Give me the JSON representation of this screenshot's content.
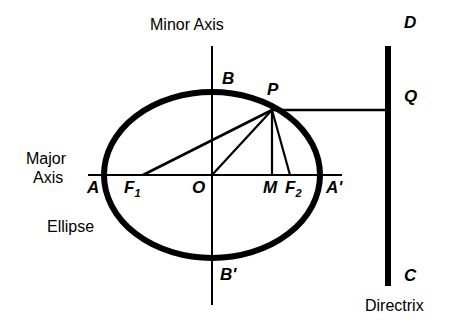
{
  "figure": {
    "background_color": "#ffffff",
    "stroke_color": "#000000"
  },
  "labels": {
    "minor_axis": "Minor Axis",
    "major_axis_line1": "Major",
    "major_axis_line2": "Axis",
    "ellipse": "Ellipse",
    "directrix": "Directrix",
    "vertex_a": "A",
    "vertex_a_prime_base": "A",
    "vertex_a_prime_mark": "'",
    "covertex_b": "B",
    "covertex_b_prime_base": "B",
    "covertex_b_prime_mark": "'",
    "center_o": "O",
    "point_p": "P",
    "point_m": "M",
    "focus_1_base": "F",
    "focus_1_sub": "1",
    "focus_2_base": "F",
    "focus_2_sub": "2",
    "directrix_top_d": "D",
    "directrix_q": "Q",
    "directrix_bottom_c": "C"
  },
  "geometry": {
    "center": {
      "x": 212,
      "y": 175
    },
    "semi_major_axis": 108,
    "semi_minor_axis": 83,
    "vertex_a": {
      "x": 104,
      "y": 175
    },
    "vertex_a_prime": {
      "x": 320,
      "y": 175
    },
    "covertex_b": {
      "x": 212,
      "y": 92
    },
    "covertex_b_prime": {
      "x": 212,
      "y": 258
    },
    "focus_1": {
      "x": 143,
      "y": 175
    },
    "focus_2": {
      "x": 290,
      "y": 175
    },
    "point_p": {
      "x": 272,
      "y": 110
    },
    "point_m": {
      "x": 272,
      "y": 175
    },
    "point_q": {
      "x": 388,
      "y": 110
    },
    "major_axis_line": {
      "x1": 88,
      "y1": 175,
      "x2": 342,
      "y2": 175
    },
    "minor_axis_line": {
      "x1": 212,
      "y1": 46,
      "x2": 212,
      "y2": 305
    },
    "directrix_line": {
      "x": 388,
      "y1": 46,
      "y2": 286
    },
    "ellipse_stroke_width": 6,
    "directrix_stroke_width": 6,
    "thin_stroke_width": 2
  },
  "segments": [
    {
      "name": "p-to-f1",
      "from": "point_p",
      "to": "focus_1"
    },
    {
      "name": "p-to-o",
      "from": "point_p",
      "to": "center"
    },
    {
      "name": "p-to-m",
      "from": "point_p",
      "to": "point_m"
    },
    {
      "name": "p-to-f2",
      "from": "point_p",
      "to": "focus_2"
    },
    {
      "name": "p-to-q",
      "from": "point_p",
      "to": "point_q"
    }
  ]
}
